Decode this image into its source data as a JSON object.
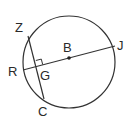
{
  "diagram": {
    "type": "circle-geometry",
    "circle": {
      "center": [
        69,
        62
      ],
      "radius": 46,
      "stroke": "#333333"
    },
    "points": {
      "Z": {
        "label": "Z",
        "pos": [
          28,
          36
        ],
        "label_pos": [
          15,
          32
        ]
      },
      "C": {
        "label": "C",
        "pos": [
          44,
          99
        ],
        "label_pos": [
          38,
          116
        ]
      },
      "R": {
        "label": "R",
        "pos": [
          23,
          70
        ],
        "label_pos": [
          8,
          76
        ]
      },
      "J": {
        "label": "J",
        "pos": [
          115,
          46
        ],
        "label_pos": [
          117,
          50
        ]
      },
      "B": {
        "label": "B",
        "pos": [
          69,
          58
        ],
        "label_pos": [
          63,
          52
        ]
      },
      "G": {
        "label": "G",
        "pos": [
          37,
          67
        ],
        "label_pos": [
          40,
          80
        ]
      }
    },
    "segments": [
      {
        "from": "R",
        "to": "J",
        "name": "diameter-RJ"
      },
      {
        "from": "Z",
        "to": "C",
        "name": "chord-ZC"
      }
    ],
    "annotations": [
      {
        "type": "right-angle",
        "at": "G"
      },
      {
        "type": "center-dot",
        "at": "B"
      }
    ]
  }
}
